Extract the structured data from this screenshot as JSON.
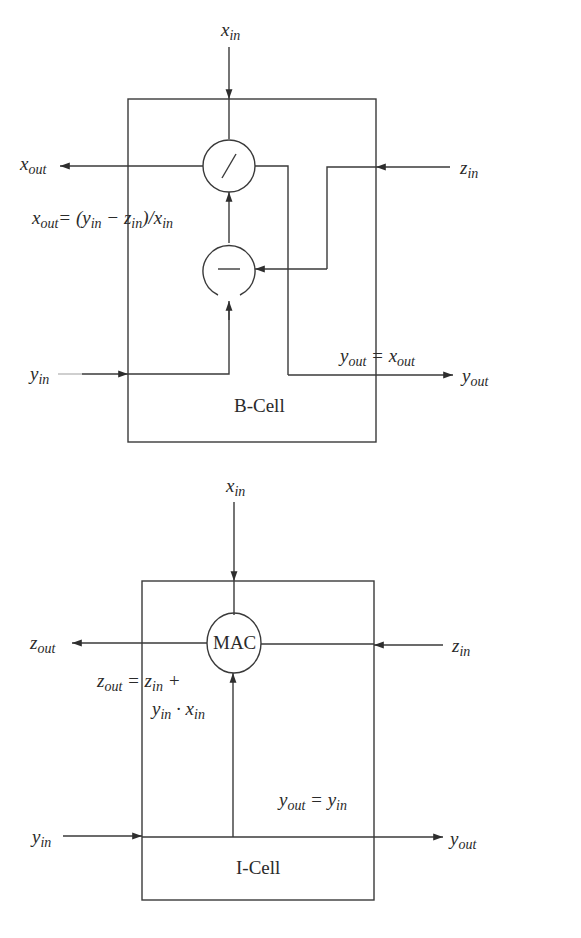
{
  "b_cell": {
    "title": "B-Cell",
    "inputs": {
      "x_in": "x",
      "y_in": "y",
      "z_in": "z"
    },
    "outputs": {
      "x_out": "x",
      "y_out": "y"
    },
    "operators": {
      "divide": "/",
      "subtract": "—"
    },
    "equations": {
      "x_out": {
        "lhs": "x",
        "lhs_sub": "out",
        "rhs": "= (y",
        "s1": "in",
        "m": " − z",
        "s2": "in",
        "e": ")/x",
        "s3": "in"
      },
      "y_out": {
        "lhs": "y",
        "lhs_sub": "out",
        "rhs": " = x",
        "rhs_sub": "out"
      }
    }
  },
  "i_cell": {
    "title": "I-Cell",
    "operator": "MAC",
    "equations": {
      "z_out_line1": {
        "lhs": "z",
        "lhs_sub": "out",
        "rhs": " = z",
        "rhs_sub": "in",
        "tail": " +"
      },
      "z_out_line2": {
        "a": "y",
        "a_sub": "in",
        "b": " · x",
        "b_sub": "in"
      },
      "y_out": {
        "lhs": "y",
        "lhs_sub": "out",
        "rhs": " = y",
        "rhs_sub": "in"
      }
    }
  },
  "subs": {
    "in": "in",
    "out": "out"
  },
  "letters": {
    "x": "x",
    "y": "y",
    "z": "z"
  },
  "colors": {
    "line": "#3a3a3a",
    "background": "#ffffff"
  }
}
